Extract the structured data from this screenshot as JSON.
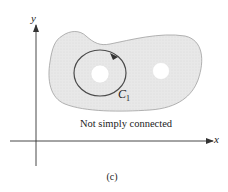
{
  "figure": {
    "panel_label": "(c)",
    "caption": "Not simply connected",
    "axes": {
      "x_label": "x",
      "y_label": "y"
    },
    "curve": {
      "label_main": "C",
      "label_sub": "1",
      "orientation": "counterclockwise"
    },
    "region": {
      "fill_color": "#e6e6e6",
      "outline_color": "#9a9a9a",
      "holes": 2
    },
    "colors": {
      "axis": "#333333",
      "curve": "#4a4a4a",
      "text": "#222222"
    }
  }
}
